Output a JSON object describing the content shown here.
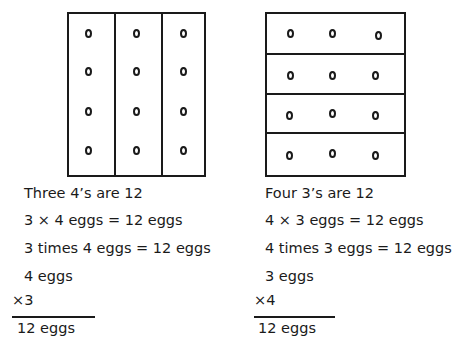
{
  "left": {
    "grouping": "3 columns of 4 eggs",
    "lines": [
      "Three 4’s are 12",
      "3 × 4 eggs = 12 eggs",
      "3 times 4 eggs = 12 eggs",
      "4 eggs"
    ],
    "multiplier": "×3",
    "result": "12 eggs"
  },
  "right": {
    "grouping": "4 rows of 3 eggs",
    "lines": [
      "Four 3’s are 12",
      "4 × 3 eggs = 12 eggs",
      "4 times 3 eggs = 12 eggs",
      "3 eggs"
    ],
    "multiplier": "×4",
    "result": "12 eggs"
  }
}
